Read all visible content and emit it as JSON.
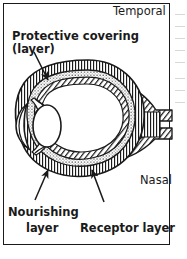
{
  "figure": {
    "border_color": "#1a1a1a",
    "background_color": "#ffffff",
    "ink_color": "#1a1a1a"
  },
  "labels": {
    "protective_covering_line1": "Protective covering",
    "protective_covering_line2": "(layer)",
    "nourishing_line1": "Nourishing",
    "nourishing_line2": "layer",
    "receptor_layer": "Receptor layer",
    "temporal": "Temporal",
    "nasal": "Nasal"
  },
  "structures": {
    "outer_layer_name": "sclera-protective-covering",
    "middle_layer_name": "choroid-nourishing-layer",
    "inner_layer_name": "retina-receptor-layer",
    "lens_name": "lens",
    "cornea_name": "cornea",
    "optic_nerve_name": "optic-nerve"
  },
  "leader_lines": {
    "protective_covering": "from-text-down-right-to-upper-eye-wall",
    "nourishing_layer": "from-text-up-right-to-lower-eye-wall",
    "receptor_layer": "from-text-up-left-to-lower-eye-wall"
  }
}
